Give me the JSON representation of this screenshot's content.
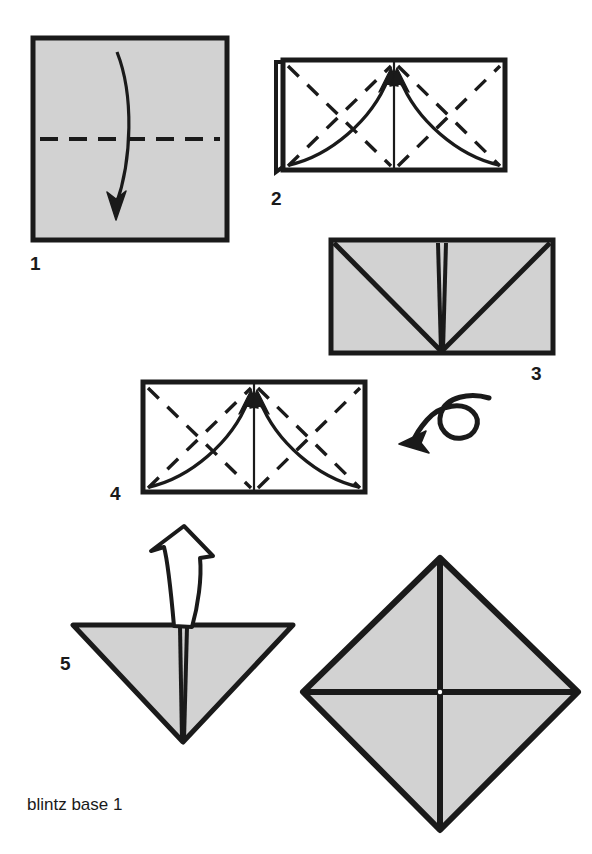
{
  "figure": {
    "caption": "blintz base 1",
    "title": "blintz base 1",
    "type": "origami-fold-diagram",
    "background_color": "#ffffff",
    "paper_fill_color": "#d2d2d2",
    "line_color": "#1a1a1a",
    "white_fill_color": "#ffffff"
  },
  "steps": [
    {
      "number": "1",
      "label": "1",
      "shape": "square",
      "fill": "paper-gray",
      "fold_lines": [
        "horizontal-dashed-center"
      ],
      "arrows": [
        "curved-arrow-down"
      ],
      "description": "Square sheet, valley fold in half downward along horizontal center"
    },
    {
      "number": "2",
      "label": "2",
      "shape": "rectangle",
      "fill": "white",
      "fold_lines": [
        "vertical-center",
        "dashed-diagonals-left",
        "dashed-diagonals-right",
        "folded-edge-left"
      ],
      "arrows": [
        "curved-arrow-up-left",
        "curved-arrow-up-right"
      ],
      "description": "Folded rectangle, fold both bottom corners up to center"
    },
    {
      "number": "3",
      "label": "3",
      "shape": "rectangle",
      "fill": "paper-gray",
      "fold_lines": [
        "diagonal-left-to-center",
        "diagonal-right-to-center",
        "vertical-center-pair"
      ],
      "arrows": [],
      "description": "Result after folding corners, V shape visible"
    },
    {
      "number": "4",
      "label": "4",
      "shape": "rectangle",
      "fill": "white",
      "fold_lines": [
        "vertical-center",
        "dashed-diagonals-left",
        "dashed-diagonals-right"
      ],
      "arrows": [
        "curved-arrow-up-left",
        "curved-arrow-up-right"
      ],
      "description": "Turned over, repeat corner folds on this side"
    },
    {
      "number": "5",
      "label": "5",
      "shape": "triangle-down",
      "fill": "paper-gray",
      "fold_lines": [
        "vertical-center"
      ],
      "arrows": [
        "hollow-arrow-up"
      ],
      "description": "Downward triangle, open out flaps upward"
    }
  ],
  "symbols": [
    {
      "name": "turn-over-symbol",
      "meaning": "turn the model over",
      "direction": "left"
    },
    {
      "name": "hollow-open-arrow",
      "meaning": "open / unfold upward",
      "direction": "up"
    }
  ],
  "result": {
    "name": "blintz-base-result",
    "shape": "diamond",
    "fill": "paper-gray",
    "fold_lines": [
      "vertical-center",
      "horizontal-center"
    ],
    "description": "Finished blintz base, diamond with cross creases"
  }
}
